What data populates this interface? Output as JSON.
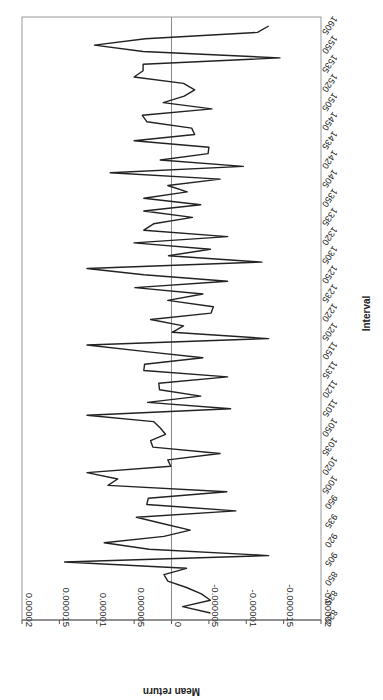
{
  "chart_data": {
    "type": "line",
    "orientation": "rotated 90 degrees clockwise (x-axis runs vertically, bottom to top)",
    "title": "",
    "xlabel": "Interval",
    "ylabel": "Mean return",
    "ylim": [
      -2e-05,
      2e-05
    ],
    "yticks": [
      "0.00002",
      "0.000015",
      "0.00001",
      "0.000005",
      "0",
      "-0.000005",
      "-0.00001",
      "-0.000015",
      "-0.00002"
    ],
    "xtick_labels": [
      "820",
      "835",
      "850",
      "905",
      "920",
      "935",
      "950",
      "1005",
      "1020",
      "1035",
      "1050",
      "1105",
      "1120",
      "1135",
      "1150",
      "1205",
      "1220",
      "1235",
      "1250",
      "1305",
      "1320",
      "1335",
      "1350",
      "1405",
      "1420",
      "1435",
      "1450",
      "1505",
      "1520",
      "1535",
      "1550",
      "1605"
    ],
    "grid": false,
    "legend": null,
    "zero_line": true,
    "series": [
      {
        "name": "Mean return",
        "color": "#222222",
        "values": [
          -5.2e-06,
          -1.5e-06,
          -5.2e-06,
          -4e-06,
          -2e-06,
          5e-07,
          1e-06,
          -2e-06,
          1.43e-05,
          -1.3e-05,
          3e-06,
          9e-06,
          1e-06,
          -2.5e-06,
          1.1e-06,
          4.7e-06,
          -8.6e-06,
          3.3e-06,
          3.1e-06,
          -7.4e-06,
          8.5e-06,
          7.2e-06,
          1.13e-05,
          1e-07,
          5e-07,
          -6.5e-06,
          2.5e-06,
          2.8e-06,
          8e-07,
          1.5e-06,
          2.4e-06,
          1.13e-05,
          -7.9e-06,
          3.2e-06,
          -3.9e-06,
          1.6e-06,
          1.7e-06,
          -7.5e-06,
          3.7e-06,
          3.6e-06,
          -4.2e-06,
          3.7e-06,
          1.13e-05,
          -1.3e-05,
          -1e-07,
          -1.6e-06,
          2.8e-06,
          -5.3e-06,
          -5.6e-06,
          5e-07,
          -4.2e-06,
          4.9e-06,
          -7.5e-06,
          3.7e-06,
          1.13e-05,
          -1.21e-05,
          4e-07,
          -5.2e-06,
          5e-06,
          -7.5e-06,
          3.7e-06,
          2.4e-06,
          -2.8e-06,
          3.7e-06,
          -3.9e-06,
          3.7e-06,
          -2.1e-06,
          5e-07,
          -6.5e-06,
          8.2e-06,
          -9.6e-06,
          1.5e-06,
          -4.9e-06,
          -5e-06,
          5e-06,
          -3.1e-06,
          -2.7e-06,
          3.3e-06,
          3.9e-06,
          -5.4e-06,
          1.1e-06,
          -1.7e-06,
          -3.1e-06,
          -1.6e-06,
          5e-06,
          3.8e-06,
          3.8e-06,
          -1.45e-05,
          3.8e-06,
          1.03e-05,
          3.5e-06,
          -1.15e-05,
          -1.3e-05
        ]
      }
    ]
  }
}
